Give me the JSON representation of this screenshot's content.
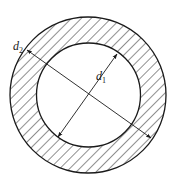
{
  "diagram": {
    "type": "annular cross-section (hollow circular shaft)",
    "outer_circle": {
      "cx": 88,
      "cy": 95,
      "r": 78,
      "fill": "hatched"
    },
    "inner_circle": {
      "cx": 88.5,
      "cy": 95,
      "r": 52,
      "fill": "#ffffff"
    },
    "hatch": {
      "direction": "diagonal, top-left to bottom-right",
      "spacing": 7,
      "color": "#222222"
    },
    "line_color": "#1a1a1a",
    "dimensions": [
      {
        "id": "d2",
        "label_main": "d",
        "label_sub": "2",
        "meaning": "outer diameter",
        "from": [
          27,
          50
        ],
        "to": [
          151,
          138
        ],
        "label_pos": [
          13,
          42
        ]
      },
      {
        "id": "d1",
        "label_main": "d",
        "label_sub": "1",
        "meaning": "inner diameter",
        "from": [
          117,
          54
        ],
        "to": [
          58,
          137
        ],
        "label_pos": [
          96,
          80
        ]
      }
    ]
  }
}
